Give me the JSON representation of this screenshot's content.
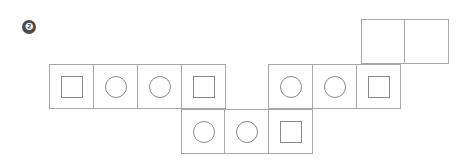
{
  "problem_number": "❷",
  "cell_size": 44,
  "colors": {
    "border": "#a8a8a8",
    "shape": "#8a8a8a",
    "badge": "#4a4a4a"
  },
  "cells": [
    {
      "x": 361,
      "y": 19,
      "shape": "empty"
    },
    {
      "x": 405,
      "y": 19,
      "shape": "empty"
    },
    {
      "x": 50,
      "y": 64,
      "shape": "square"
    },
    {
      "x": 94,
      "y": 64,
      "shape": "circle"
    },
    {
      "x": 138,
      "y": 64,
      "shape": "circle"
    },
    {
      "x": 182,
      "y": 64,
      "shape": "square"
    },
    {
      "x": 269,
      "y": 64,
      "shape": "circle"
    },
    {
      "x": 313,
      "y": 64,
      "shape": "circle"
    },
    {
      "x": 357,
      "y": 64,
      "shape": "square"
    },
    {
      "x": 182,
      "y": 109,
      "shape": "circle"
    },
    {
      "x": 225,
      "y": 109,
      "shape": "circle"
    },
    {
      "x": 269,
      "y": 109,
      "shape": "square"
    }
  ]
}
